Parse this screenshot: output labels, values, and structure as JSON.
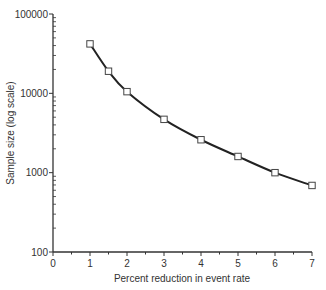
{
  "chart_data": {
    "type": "line",
    "title": "",
    "xlabel": "Percent reduction in event rate",
    "ylabel": "Sample size (log scale)",
    "y_scale": "log",
    "xlim": [
      0,
      7
    ],
    "ylim": [
      100,
      100000
    ],
    "x_ticks": [
      0,
      1,
      2,
      3,
      4,
      5,
      6,
      7
    ],
    "x_tick_labels": [
      "0",
      "1",
      "2",
      "3",
      "4",
      "5",
      "6",
      "7"
    ],
    "y_ticks": [
      100,
      1000,
      10000,
      100000
    ],
    "y_tick_labels": [
      "100",
      "1000",
      "10000",
      "100000"
    ],
    "grid": false,
    "legend": null,
    "marker": "open-square",
    "series": [
      {
        "name": "Sample size",
        "x": [
          1,
          1.5,
          2,
          3,
          4,
          5,
          6,
          7
        ],
        "values": [
          42000,
          19000,
          10500,
          4700,
          2600,
          1600,
          1000,
          690
        ]
      }
    ]
  },
  "colors": {
    "line": "#222222",
    "axis": "#333333",
    "marker_fill": "#ffffff"
  }
}
